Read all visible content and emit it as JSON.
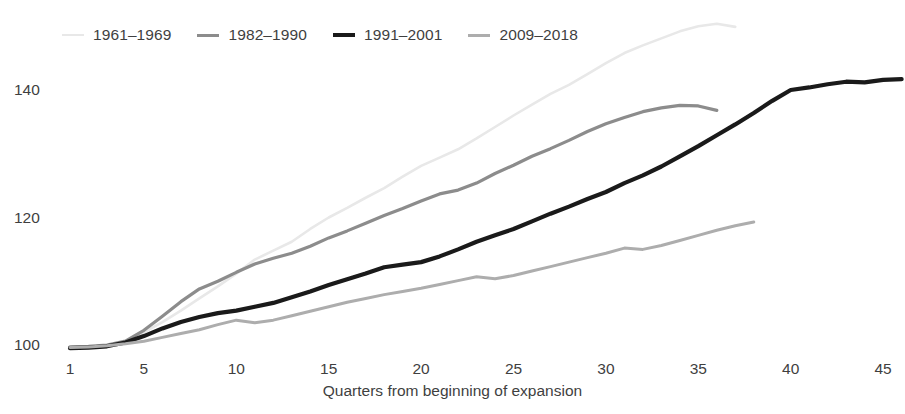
{
  "legend": {
    "position": "top-left",
    "items": [
      {
        "label": "1961–1969",
        "color": "#e8e8e8",
        "width": 2.6
      },
      {
        "label": "1982–1990",
        "color": "#8c8c8c",
        "width": 3.2
      },
      {
        "label": "1991–2001",
        "color": "#1a1a1a",
        "width": 4.2
      },
      {
        "label": "2009–2018",
        "color": "#adadad",
        "width": 3.0
      }
    ]
  },
  "axes": {
    "y_ticks": [
      100,
      120,
      140
    ],
    "x_ticks": [
      1,
      5,
      10,
      15,
      20,
      25,
      30,
      35,
      40,
      45
    ],
    "x_title": "Quarters from beginning of expansion",
    "y_title": ""
  },
  "chart_data": {
    "type": "line",
    "title": "",
    "subtitle": "",
    "xlabel": "Quarters from beginning of expansion",
    "ylabel": "",
    "xlim": [
      1,
      46
    ],
    "ylim": [
      98,
      150
    ],
    "grid": false,
    "legend_position": "top-left",
    "x_ticks": [
      1,
      5,
      10,
      15,
      20,
      25,
      30,
      35,
      40,
      45
    ],
    "y_ticks": [
      100,
      120,
      140
    ],
    "series": [
      {
        "name": "1961–1969",
        "color": "#e8e8e8",
        "x": [
          1,
          2,
          3,
          4,
          5,
          6,
          7,
          8,
          9,
          10,
          11,
          12,
          13,
          14,
          15,
          16,
          17,
          18,
          19,
          20,
          21,
          22,
          23,
          24,
          25,
          26,
          27,
          28,
          29,
          30,
          31,
          32,
          33,
          34,
          35,
          36,
          37
        ],
        "values": [
          99.6,
          99.7,
          99.9,
          100.4,
          102.0,
          103.6,
          105.4,
          107.3,
          109.2,
          111.2,
          113.4,
          114.8,
          116.2,
          118.2,
          120.0,
          121.5,
          123.1,
          124.6,
          126.4,
          128.1,
          129.4,
          130.7,
          132.4,
          134.2,
          136.0,
          137.7,
          139.4,
          140.8,
          142.5,
          144.2,
          145.8,
          147.0,
          148.1,
          149.2,
          150.0,
          150.4,
          149.9
        ]
      },
      {
        "name": "1982–1990",
        "color": "#8c8c8c",
        "x": [
          1,
          2,
          3,
          4,
          5,
          6,
          7,
          8,
          9,
          10,
          11,
          12,
          13,
          14,
          15,
          16,
          17,
          18,
          19,
          20,
          21,
          22,
          23,
          24,
          25,
          26,
          27,
          28,
          29,
          30,
          31,
          32,
          33,
          34,
          35,
          36
        ],
        "values": [
          99.7,
          99.8,
          100.0,
          100.6,
          102.3,
          104.5,
          106.8,
          108.8,
          110.0,
          111.4,
          112.7,
          113.6,
          114.4,
          115.5,
          116.8,
          117.9,
          119.1,
          120.3,
          121.4,
          122.6,
          123.7,
          124.3,
          125.4,
          126.9,
          128.2,
          129.6,
          130.8,
          132.1,
          133.5,
          134.7,
          135.7,
          136.6,
          137.2,
          137.6,
          137.5,
          136.8
        ]
      },
      {
        "name": "1991–2001",
        "color": "#1a1a1a",
        "x": [
          1,
          2,
          3,
          4,
          5,
          6,
          7,
          8,
          9,
          10,
          11,
          12,
          13,
          14,
          15,
          16,
          17,
          18,
          19,
          20,
          21,
          22,
          23,
          24,
          25,
          26,
          27,
          28,
          29,
          30,
          31,
          32,
          33,
          34,
          35,
          36,
          37,
          38,
          39,
          40,
          41,
          42,
          43,
          44,
          45,
          46
        ],
        "values": [
          99.5,
          99.6,
          99.8,
          100.4,
          101.4,
          102.6,
          103.6,
          104.4,
          105.0,
          105.4,
          106.0,
          106.6,
          107.5,
          108.4,
          109.4,
          110.3,
          111.2,
          112.2,
          112.6,
          113.0,
          113.9,
          115.0,
          116.2,
          117.2,
          118.2,
          119.4,
          120.6,
          121.7,
          122.9,
          124.0,
          125.4,
          126.6,
          128.0,
          129.6,
          131.2,
          132.9,
          134.6,
          136.4,
          138.3,
          140.0,
          140.4,
          140.9,
          141.3,
          141.2,
          141.6,
          141.7
        ]
      },
      {
        "name": "2009–2018",
        "color": "#adadad",
        "x": [
          1,
          2,
          3,
          4,
          5,
          6,
          7,
          8,
          9,
          10,
          11,
          12,
          13,
          14,
          15,
          16,
          17,
          18,
          19,
          20,
          21,
          22,
          23,
          24,
          25,
          26,
          27,
          28,
          29,
          30,
          31,
          32,
          33,
          34,
          35,
          36,
          37,
          38
        ],
        "values": [
          99.6,
          99.7,
          99.9,
          100.2,
          100.6,
          101.2,
          101.8,
          102.4,
          103.2,
          103.9,
          103.5,
          103.9,
          104.6,
          105.3,
          106.0,
          106.7,
          107.3,
          107.9,
          108.4,
          108.9,
          109.5,
          110.1,
          110.7,
          110.4,
          110.9,
          111.6,
          112.3,
          113.0,
          113.7,
          114.4,
          115.2,
          115.0,
          115.6,
          116.4,
          117.2,
          118.0,
          118.7,
          119.3
        ]
      }
    ]
  }
}
